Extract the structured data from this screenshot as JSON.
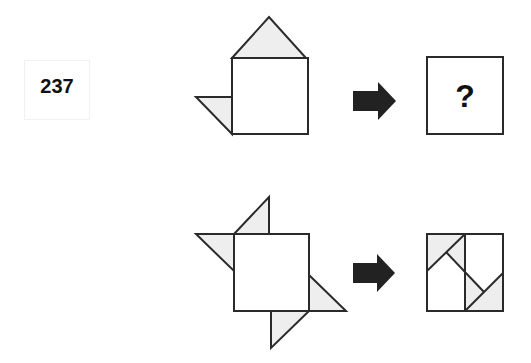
{
  "puzzle": {
    "number": "237",
    "question_mark": "?",
    "colors": {
      "stroke": "#2a2a2a",
      "fill_shade": "#eeeeee",
      "fill_white": "#ffffff",
      "arrow": "#222222",
      "text": "#111111"
    },
    "rows": [
      {
        "name": "question-row",
        "source_figure": {
          "square": [
            232,
            58,
            76,
            76
          ],
          "triangles": [
            [
              [
                232,
                58
              ],
              [
                269,
                17
              ],
              [
                306,
                58
              ]
            ],
            [
              [
                196,
                97
              ],
              [
                232,
                97
              ],
              [
                232,
                134
              ]
            ]
          ]
        },
        "arrow": {
          "shaft": [
            353,
            91,
            25,
            20
          ],
          "head": [
            [
              378,
              82
            ],
            [
              396,
              101
            ],
            [
              378,
              120
            ]
          ]
        },
        "result_box": [
          427,
          57,
          76,
          77
        ],
        "result": "question"
      },
      {
        "name": "example-row",
        "source_figure": {
          "square": [
            234,
            234,
            75,
            77
          ],
          "triangles": [
            [
              [
                234,
                234
              ],
              [
                269,
                197
              ],
              [
                269,
                234
              ]
            ],
            [
              [
                196,
                234
              ],
              [
                234,
                234
              ],
              [
                234,
                271
              ]
            ],
            [
              [
                309,
                275
              ],
              [
                346,
                311
              ],
              [
                309,
                311
              ]
            ],
            [
              [
                271,
                311
              ],
              [
                309,
                311
              ],
              [
                271,
                348
              ]
            ]
          ]
        },
        "arrow": {
          "shaft": [
            353,
            263,
            24,
            20
          ],
          "head": [
            [
              377,
              254
            ],
            [
              395,
              273
            ],
            [
              377,
              292
            ]
          ]
        },
        "result_box": [
          427,
          234,
          76,
          77
        ],
        "result": "folded",
        "folded_shaded": [
          [
            [
              427,
              234
            ],
            [
              465,
              234
            ],
            [
              427,
              271
            ]
          ],
          [
            [
              446,
              252
            ],
            [
              465,
              234
            ],
            [
              465,
              271
            ]
          ],
          [
            [
              465,
              311
            ],
            [
              503,
              311
            ],
            [
              503,
              273
            ]
          ],
          [
            [
              465,
              273
            ],
            [
              484,
              292
            ],
            [
              465,
              311
            ]
          ]
        ],
        "folded_lines": [
          [
            [
              465,
              234
            ],
            [
              465,
              311
            ]
          ],
          [
            [
              427,
              271
            ],
            [
              465,
              234
            ]
          ],
          [
            [
              446,
              252
            ],
            [
              484,
              292
            ]
          ],
          [
            [
              503,
              273
            ],
            [
              465,
              311
            ]
          ]
        ]
      }
    ]
  }
}
